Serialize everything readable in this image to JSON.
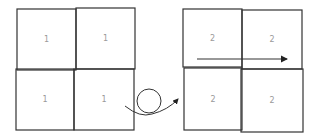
{
  "diagram": {
    "left_grid": {
      "cells": [
        {
          "label": "1",
          "x": 17,
          "y": 9,
          "w": 59,
          "h": 61
        },
        {
          "label": "1",
          "x": 76,
          "y": 8,
          "w": 59,
          "h": 61
        },
        {
          "label": "1",
          "x": 16,
          "y": 69,
          "w": 58,
          "h": 61
        },
        {
          "label": "1",
          "x": 74,
          "y": 69,
          "w": 60,
          "h": 61
        }
      ]
    },
    "right_grid": {
      "cells": [
        {
          "label": "2",
          "x": 183,
          "y": 9,
          "w": 59,
          "h": 58
        },
        {
          "label": "2",
          "x": 242,
          "y": 10,
          "w": 60,
          "h": 59
        },
        {
          "label": "2",
          "x": 184,
          "y": 68,
          "w": 58,
          "h": 62
        },
        {
          "label": "2",
          "x": 241,
          "y": 69,
          "w": 62,
          "h": 63
        }
      ]
    },
    "loop_arrow": {
      "circle_cx": 149,
      "circle_cy": 101,
      "r": 12
    },
    "horizontal_arrow": {
      "x1": 197,
      "y1": 59,
      "x2": 287,
      "y2": 59
    },
    "stroke_color": "#333333",
    "label_color": "#9a9a9a"
  }
}
